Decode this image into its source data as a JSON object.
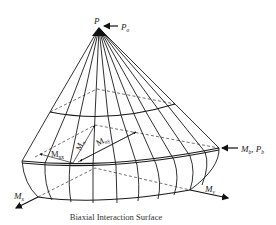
{
  "diagram": {
    "title": "Biaxial Interaction Surface",
    "labels": {
      "apex": "P",
      "axial_load": "P",
      "axial_load_sub": "o",
      "x_moment": "M",
      "x_moment_sub": "x",
      "y_moment": "M",
      "y_moment_sub": "y",
      "balanced_moment": "M",
      "balanced_moment_sub": "b",
      "balanced_load": "P",
      "balanced_load_sub": "b",
      "moment_nx": "M",
      "moment_nx_sub": "nx",
      "moment_ny": "M",
      "moment_ny_sub": "ny",
      "moment_n": "M",
      "moment_n_sub": "n",
      "comma": ","
    },
    "colors": {
      "line": "#1a1a1a",
      "background": "#ffffff",
      "caption": "#333333"
    }
  }
}
